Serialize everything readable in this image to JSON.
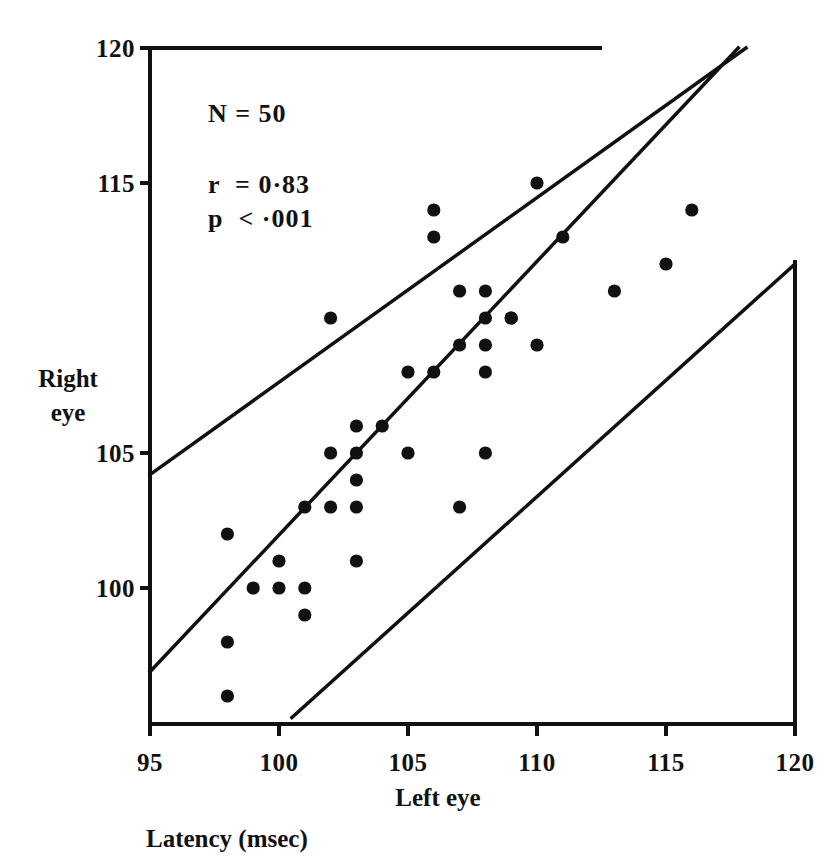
{
  "figure": {
    "background_color": "#ffffff",
    "ink_color": "#111111"
  },
  "annotations": {
    "n_label": "N = 50",
    "r_label": "r  = 0·83",
    "p_label": "p  < ·001"
  },
  "axes": {
    "x": {
      "title": "Left eye",
      "sub_title": "Latency (msec)",
      "ticks": [
        "95",
        "100",
        "105",
        "110",
        "115",
        "120"
      ],
      "tick_values": [
        95,
        100,
        105,
        110,
        115,
        120
      ],
      "min": 95,
      "max": 120
    },
    "y": {
      "title_line1": "Right",
      "title_line2": "eye",
      "ticks": [
        "100",
        "105",
        "115",
        "120"
      ],
      "tick_values": [
        100,
        105,
        115,
        120
      ],
      "min": 95.2,
      "max": 120
    }
  },
  "chart_data": {
    "type": "scatter",
    "title": "",
    "subtitle": "",
    "xlabel": "Left eye",
    "ylabel": "Right eye",
    "axis_units": "Latency (msec)",
    "xlim": [
      95,
      120
    ],
    "ylim": [
      95.2,
      120
    ],
    "xticks": [
      95,
      100,
      105,
      110,
      115,
      120
    ],
    "yticks": [
      100,
      105,
      115,
      120
    ],
    "grid": false,
    "legend": null,
    "n_points_stated": 50,
    "correlation_r": 0.83,
    "p_value_text": "< .001",
    "annotations": [
      "N = 50",
      "r  = 0·83",
      "p  < ·001"
    ],
    "series": [
      {
        "name": "Subjects",
        "marker": "filled-circle",
        "marker_color": "#111111",
        "points": [
          [
            98,
            102
          ],
          [
            98,
            98
          ],
          [
            98,
            96
          ],
          [
            99,
            100
          ],
          [
            100,
            101
          ],
          [
            100,
            100
          ],
          [
            101,
            103
          ],
          [
            101,
            100
          ],
          [
            101,
            99
          ],
          [
            102,
            110
          ],
          [
            102,
            105
          ],
          [
            102,
            103
          ],
          [
            103,
            106
          ],
          [
            103,
            105
          ],
          [
            103,
            104
          ],
          [
            103,
            103
          ],
          [
            103,
            101
          ],
          [
            104,
            106
          ],
          [
            105,
            108
          ],
          [
            105,
            105
          ],
          [
            106,
            114
          ],
          [
            106,
            113
          ],
          [
            106,
            108
          ],
          [
            107,
            111
          ],
          [
            107,
            109
          ],
          [
            107,
            103
          ],
          [
            108,
            111
          ],
          [
            108,
            110
          ],
          [
            108,
            109
          ],
          [
            108,
            108
          ],
          [
            108,
            105
          ],
          [
            109,
            110
          ],
          [
            109,
            110
          ],
          [
            110,
            115
          ],
          [
            110,
            109
          ],
          [
            111,
            113
          ],
          [
            113,
            111
          ],
          [
            115,
            112
          ],
          [
            116,
            114
          ]
        ]
      }
    ],
    "reference_lines": [
      {
        "name": "upper-limit-line",
        "description": "Upper limit of agreement (identity line offset up)",
        "from": [
          95,
          104.2
        ],
        "to": [
          118.1,
          120.0
        ]
      },
      {
        "name": "identity-line",
        "description": "Line of equality / regression reference",
        "from": [
          95,
          96.9
        ],
        "to": [
          117.8,
          120.0
        ]
      },
      {
        "name": "lower-limit-line",
        "description": "Lower limit of agreement (identity line offset down)",
        "from": [
          100.5,
          95.2
        ],
        "to": [
          120,
          112.0
        ]
      }
    ]
  }
}
